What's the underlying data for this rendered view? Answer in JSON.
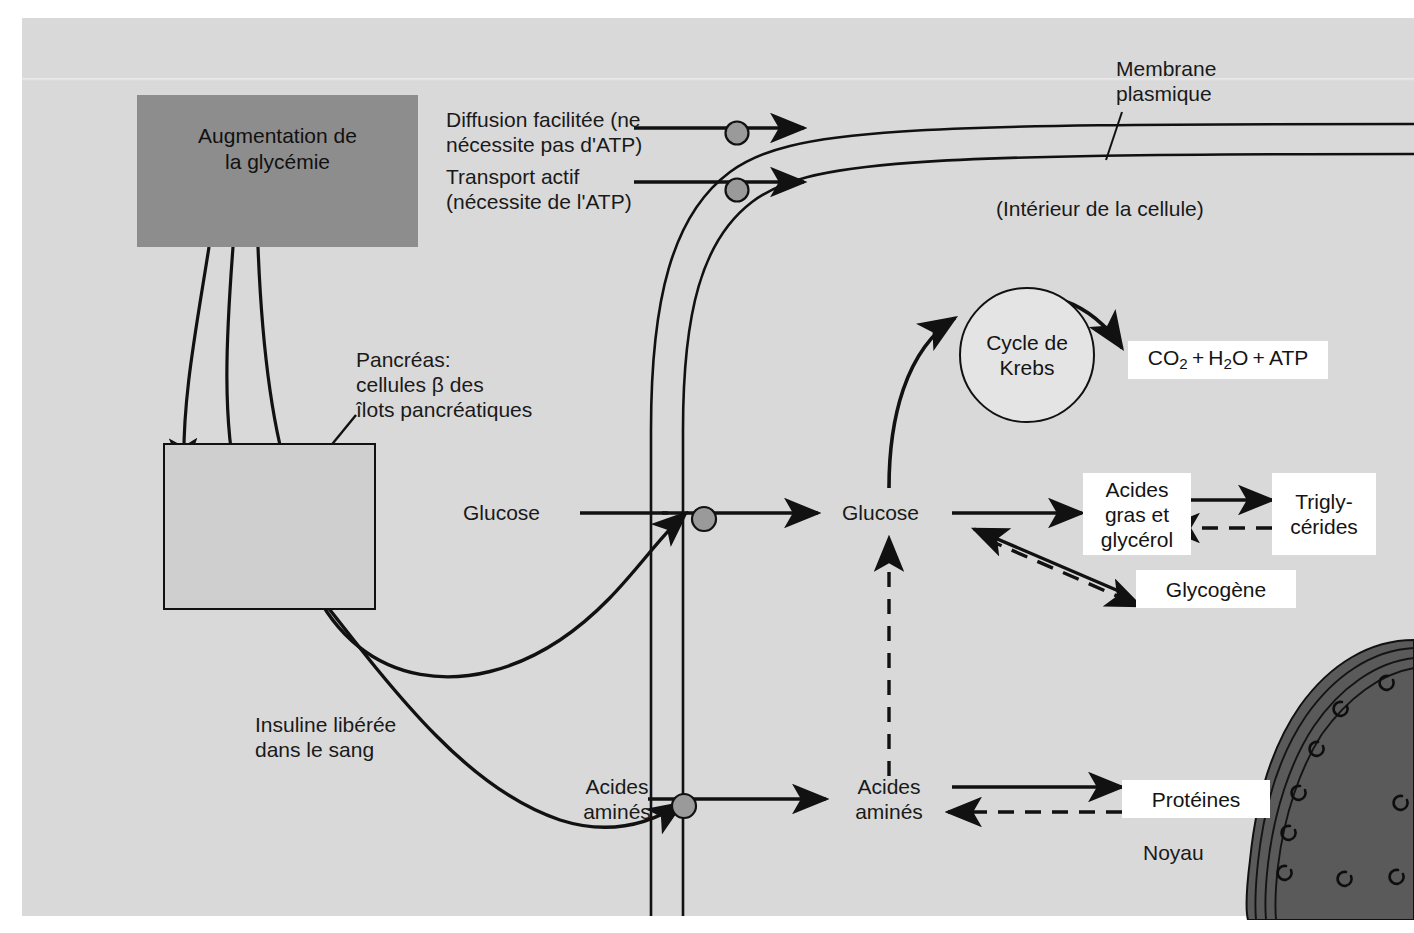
{
  "figure": {
    "background_color": "#d9d9d9",
    "accent_box_color": "#8d8d8d",
    "carrier_color": "#9a9a9a"
  },
  "legend": {
    "facilitated_diffusion": "Diffusion facilitée (ne\nnécessite pas d'ATP)",
    "active_transport": "Transport actif\n(nécessite de l'ATP)"
  },
  "labels": {
    "glycemia": "Augmentation de\nla glycémie",
    "pancreas": "Pancréas:\ncellules β des\nîlots pancréatiques",
    "insulin": "Insuline libérée\ndans le sang",
    "membrane": "Membrane\nplasmique",
    "cell_interior": "(Intérieur de la cellule)",
    "nucleus": "Noyau",
    "glucose_outside": "Glucose",
    "glucose_inside": "Glucose",
    "amino_acids_outside": "Acides\naminés",
    "amino_acids_inside": "Acides\naminés",
    "krebs": "Cycle de\nKrebs"
  },
  "boxes": {
    "co2": "CO2 + H2O + ATP",
    "fatty_acids": "Acides\ngras et\nglycérol",
    "triglycerides": "Trigly-\ncérides",
    "glycogen": "Glycogène",
    "proteins": "Protéines"
  }
}
